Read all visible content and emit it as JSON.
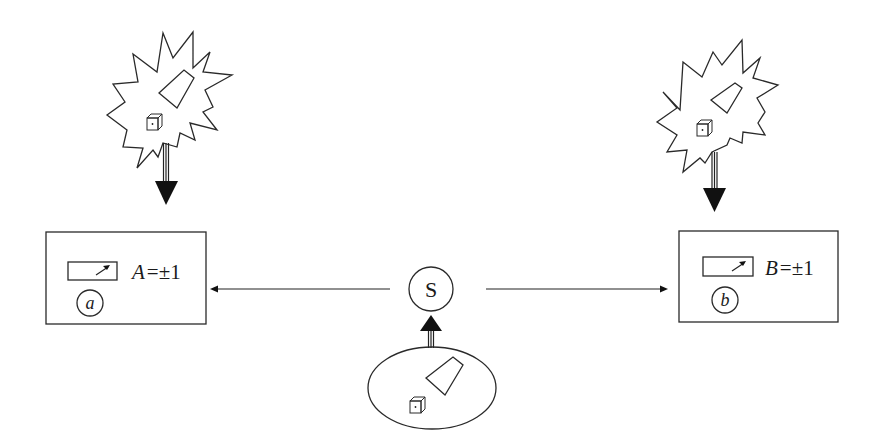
{
  "diagram": {
    "type": "bell-experiment-schematic",
    "source": {
      "label": "S",
      "shape": "circle"
    },
    "source_origin": {
      "shape": "ellipse",
      "contents": [
        "trapezoid-object",
        "die"
      ]
    },
    "detectors": [
      {
        "id": "a",
        "circle_label": "a",
        "outcome_variable": "A",
        "outcome_rest": "=±1",
        "side": "left",
        "influence": "starburst with trapezoid-object and die, arrow pointing down into detector"
      },
      {
        "id": "b",
        "circle_label": "b",
        "outcome_variable": "B",
        "outcome_rest": "=±1",
        "side": "right",
        "influence": "starburst with trapezoid-object and die, arrow pointing down into detector"
      }
    ],
    "edges": [
      {
        "from": "S",
        "to": "a",
        "style": "thin-arrow"
      },
      {
        "from": "S",
        "to": "b",
        "style": "thin-arrow"
      },
      {
        "from": "source_origin",
        "to": "S",
        "style": "bold-arrow"
      },
      {
        "from": "starburst-left",
        "to": "a",
        "style": "bold-arrow"
      },
      {
        "from": "starburst-right",
        "to": "b",
        "style": "bold-arrow"
      }
    ],
    "colors": {
      "stroke": "#2a2a2a",
      "background": "#ffffff"
    }
  }
}
